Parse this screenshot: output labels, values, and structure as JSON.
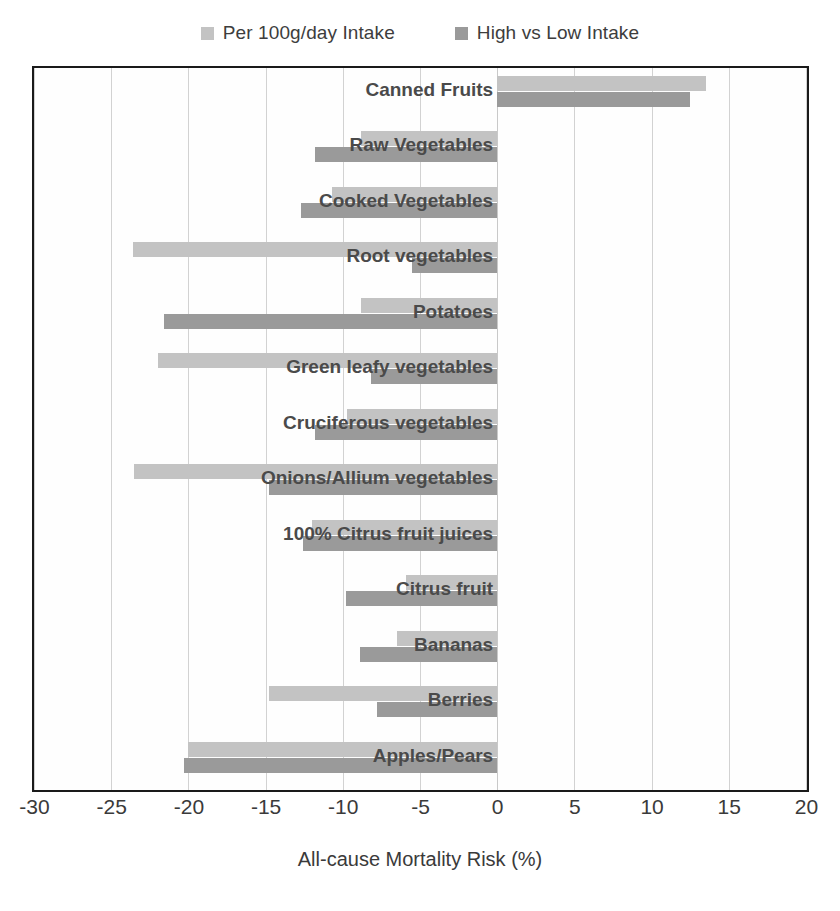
{
  "chart_data": {
    "type": "bar",
    "orientation": "horizontal",
    "title": "",
    "xlabel": "All-cause Mortality Risk (%)",
    "ylabel": "",
    "xlim": [
      -30,
      20
    ],
    "xticks": [
      -30,
      -25,
      -20,
      -15,
      -10,
      -5,
      0,
      5,
      10,
      15,
      20
    ],
    "xtick_labels": [
      "-30",
      "-25",
      "-20",
      "-15",
      "-10",
      "-5",
      "0",
      "5",
      "10",
      "15",
      "20"
    ],
    "grid": true,
    "legend_position": "top-center",
    "categories": [
      "Canned Fruits",
      "Raw Vegetables",
      "Cooked Vegetables",
      "Root vegetables",
      "Potatoes",
      "Green leafy vegetables",
      "Cruciferous vegetables",
      "Onions/Allium vegetables",
      "100% Citrus fruit juices",
      "Citrus fruit",
      "Bananas",
      "Berries",
      "Apples/Pears"
    ],
    "series": [
      {
        "name": "Per 100g/day Intake",
        "color": "#c3c3c3",
        "values": [
          13.5,
          -8.8,
          -10.7,
          -23.6,
          -8.8,
          -22.0,
          -9.7,
          -23.5,
          -12.0,
          -5.9,
          -6.5,
          -14.8,
          -20.0
        ]
      },
      {
        "name": "High vs Low Intake",
        "color": "#9a9a9a",
        "values": [
          12.5,
          -11.8,
          -12.7,
          -5.5,
          -21.6,
          -8.2,
          -11.8,
          -14.8,
          -12.6,
          -9.8,
          -8.9,
          -7.8,
          -20.3
        ]
      }
    ]
  },
  "legend": {
    "items": [
      {
        "label": "Per 100g/day Intake",
        "color": "#c3c3c3"
      },
      {
        "label": "High vs Low Intake",
        "color": "#9a9a9a"
      }
    ]
  },
  "axis": {
    "x_title": "All-cause Mortality Risk (%)"
  },
  "colors": {
    "series_light": "#c3c3c3",
    "series_dark": "#9a9a9a",
    "plot_border": "#1a1a1a",
    "gridline": "#d2d2d2",
    "label_text": "#4a4a4a",
    "background": "#ffffff"
  }
}
